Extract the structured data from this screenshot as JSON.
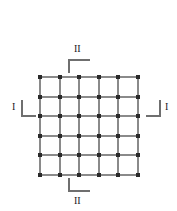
{
  "figure": {
    "background_color": "#ffffff",
    "width": 177,
    "height": 211
  },
  "grid": {
    "type": "square-lattice",
    "columns": 5,
    "rows": 5,
    "nodes_x": 6,
    "nodes_y": 6,
    "line_color": "#8a8a8a",
    "node_color": "#2a2a2a",
    "origin_x": 39,
    "origin_y": 76,
    "size": 98,
    "spacing": 19.6
  },
  "markers": {
    "top": {
      "label": "II",
      "bracket": "corner-top-left",
      "position": "top"
    },
    "bottom": {
      "label": "II",
      "bracket": "corner-bottom-left",
      "position": "bottom"
    },
    "left": {
      "label": "I",
      "bracket": "corner-bottom-left",
      "position": "left"
    },
    "right": {
      "label": "I",
      "bracket": "corner-bottom-right",
      "position": "right"
    }
  }
}
